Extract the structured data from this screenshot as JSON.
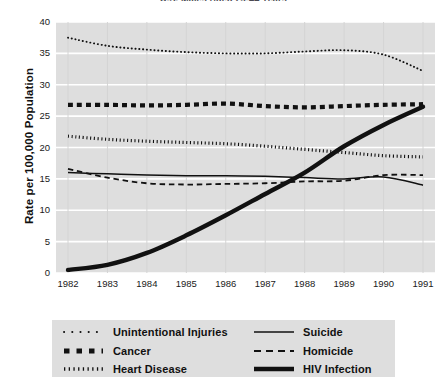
{
  "title": "U.S. Males Aged 25-44 Years",
  "axes": {
    "ylabel": "Rate per 100,000 Population",
    "yticks": [
      "0",
      "5",
      "10",
      "15",
      "20",
      "25",
      "30",
      "35",
      "40"
    ],
    "xticks": [
      "1982",
      "1983",
      "1984",
      "1985",
      "1986",
      "1987",
      "1988",
      "1989",
      "1990",
      "1991"
    ]
  },
  "legend": {
    "left": [
      {
        "label": "Unintentional Injuries",
        "style": "fine-dotted",
        "sample": "dotted-thin"
      },
      {
        "label": "Cancer",
        "style": "thick-dashed",
        "sample": "squares"
      },
      {
        "label": "Heart Disease",
        "style": "dense-dotted",
        "sample": "dotted-dense"
      }
    ],
    "right": [
      {
        "label": "Suicide",
        "style": "thin-solid",
        "sample": "solid-thin"
      },
      {
        "label": "Homicide",
        "style": "thin-dashed",
        "sample": "dashed-thin"
      },
      {
        "label": "HIV Infection",
        "style": "thick-solid",
        "sample": "solid-thick"
      }
    ]
  },
  "colors": {
    "plot_background": "#dedede",
    "gridline": "#ffffff",
    "series": "#111111",
    "page_background": "#ffffff",
    "text": "#111111"
  },
  "chart_data": {
    "type": "line",
    "title": "U.S. Males Aged 25-44 Years",
    "xlabel": "",
    "ylabel": "Rate per 100,000 Population",
    "xlim": [
      1982,
      1991
    ],
    "ylim": [
      0,
      40
    ],
    "ytick_step": 5,
    "grid": true,
    "legend_position": "below",
    "x": [
      1982,
      1983,
      1984,
      1985,
      1986,
      1987,
      1988,
      1989,
      1990,
      1991
    ],
    "series": [
      {
        "name": "Unintentional Injuries",
        "line_style": "fine-dotted",
        "values": [
          37.5,
          36.2,
          35.6,
          35.2,
          35.0,
          35.0,
          35.3,
          35.5,
          34.8,
          32.2
        ]
      },
      {
        "name": "Cancer",
        "line_style": "thick-dashed",
        "values": [
          26.8,
          26.8,
          26.7,
          26.8,
          27.0,
          26.6,
          26.4,
          26.6,
          26.8,
          26.9
        ]
      },
      {
        "name": "Heart Disease",
        "line_style": "dense-dotted",
        "values": [
          21.8,
          21.3,
          21.0,
          20.8,
          20.6,
          20.2,
          19.7,
          19.2,
          18.7,
          18.5
        ]
      },
      {
        "name": "Suicide",
        "line_style": "thin-solid",
        "values": [
          16.0,
          15.8,
          15.6,
          15.5,
          15.5,
          15.4,
          15.2,
          15.0,
          15.3,
          14.0
        ]
      },
      {
        "name": "Homicide",
        "line_style": "thin-dashed",
        "values": [
          16.6,
          15.2,
          14.3,
          14.1,
          14.2,
          14.3,
          14.6,
          14.7,
          15.6,
          15.6
        ]
      },
      {
        "name": "HIV Infection",
        "line_style": "thick-solid",
        "values": [
          0.5,
          1.3,
          3.2,
          6.0,
          9.2,
          12.6,
          16.0,
          20.2,
          23.6,
          26.5
        ]
      }
    ]
  }
}
